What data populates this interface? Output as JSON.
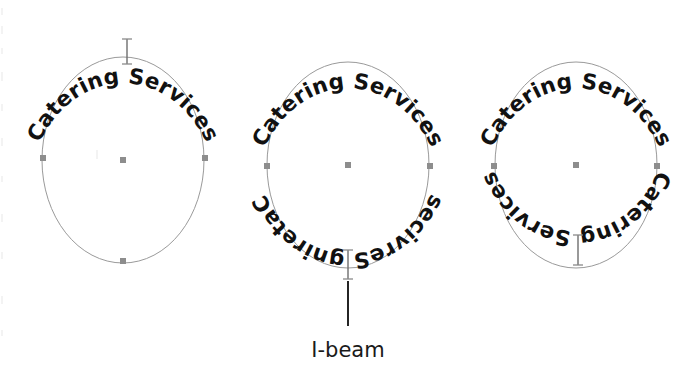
{
  "canvas": {
    "width": 696,
    "height": 377,
    "background": "#ffffff",
    "description": "Three ellipse paths with text fitted to path, illustrating I-beam cursor placement"
  },
  "colors": {
    "text": "#111111",
    "outline": "#9a9a9a",
    "node": "#8d8d8d",
    "ibeam": "#6e6e6e",
    "leader": "#1a1a1a",
    "caption": "#1a1a1a"
  },
  "path_text": {
    "value": "Catering Services",
    "font_weight": "bold",
    "font_size_px": 21.5
  },
  "shapes": [
    {
      "id": "ellipse-1",
      "center": {
        "x": 123,
        "y": 160
      },
      "radius": {
        "x": 81,
        "y": 103
      },
      "top_text": "Catering Services",
      "bottom_text": null,
      "ibeam": {
        "x": 127,
        "y": 50,
        "height": 26
      },
      "nodes": [
        {
          "name": "node-left",
          "x": 43,
          "y": 158
        },
        {
          "name": "node-center",
          "x": 123,
          "y": 160
        },
        {
          "name": "node-right",
          "x": 205,
          "y": 158
        },
        {
          "name": "node-bottom",
          "x": 123,
          "y": 261
        }
      ]
    },
    {
      "id": "ellipse-2",
      "center": {
        "x": 348,
        "y": 165
      },
      "radius": {
        "x": 81,
        "y": 103
      },
      "top_text": "Catering Services",
      "bottom_text": "Catering Services",
      "bottom_text_orientation": "inverted",
      "ibeam": {
        "x": 348,
        "y": 265,
        "height": 30
      },
      "nodes": [
        {
          "name": "node-left",
          "x": 267,
          "y": 166
        },
        {
          "name": "node-center",
          "x": 348,
          "y": 165
        },
        {
          "name": "node-right",
          "x": 430,
          "y": 166
        }
      ]
    },
    {
      "id": "ellipse-3",
      "center": {
        "x": 576,
        "y": 165
      },
      "radius": {
        "x": 81,
        "y": 103
      },
      "top_text": "Catering Services",
      "bottom_text": "Catering Services",
      "bottom_text_orientation": "upright",
      "ibeam": {
        "x": 578,
        "y": 250,
        "height": 30
      },
      "nodes": [
        {
          "name": "node-left",
          "x": 494,
          "y": 166
        },
        {
          "name": "node-center",
          "x": 576,
          "y": 165
        },
        {
          "name": "node-right",
          "x": 657,
          "y": 166
        }
      ]
    }
  ],
  "annotation": {
    "label": "I-beam",
    "label_position": {
      "x": 343,
      "y": 356
    },
    "leader_line": {
      "x": 348,
      "y1": 278,
      "y2": 325
    }
  }
}
